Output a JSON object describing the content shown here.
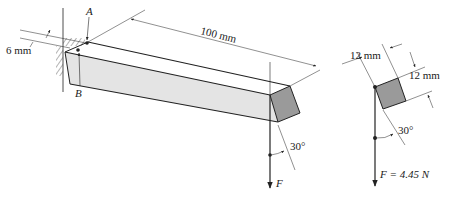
{
  "figure": {
    "type": "mechanics-diagram"
  },
  "labels": {
    "point_a": "A",
    "point_b": "B",
    "offset_dim": "6 mm",
    "length_dim": "100 mm",
    "angle_main": "30°",
    "force_main": "F",
    "section_width": "12 mm",
    "section_height": "12 mm",
    "angle_section": "30°",
    "force_section": "F = 4.45 N"
  },
  "colors": {
    "line": "#222222",
    "beam_side": "#e4e4e4",
    "beam_end": "#9a9a9a",
    "background": "#ffffff"
  }
}
